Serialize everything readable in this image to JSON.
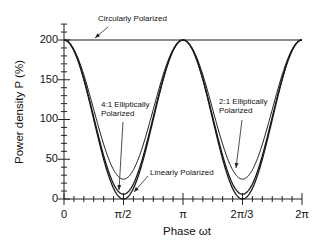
{
  "chart_data": {
    "type": "line",
    "title": "",
    "xlabel": "Phase ωt",
    "ylabel": "Power density P  (%)",
    "xlim": [
      0,
      6.2832
    ],
    "ylim": [
      0,
      200
    ],
    "x_tick_labels": [
      "0",
      "π/2",
      "π",
      "2π/3",
      "2π"
    ],
    "y_tick_labels": [
      "0",
      "50",
      "100",
      "150",
      "200"
    ],
    "grid": false,
    "legend": "none (inline annotations)",
    "series": [
      {
        "name": "Circularly Polarized",
        "formula": "P = 200 (constant)",
        "min": 200,
        "max": 200
      },
      {
        "name": "2:1 Elliptically Polarized",
        "min": 25,
        "max": 200,
        "min_at": [
          "π/2",
          "3π/2"
        ],
        "max_at": [
          "0",
          "π",
          "2π"
        ]
      },
      {
        "name": "4:1 Elliptically Polarized",
        "min": 6,
        "max": 200,
        "min_at": [
          "π/2",
          "3π/2"
        ],
        "max_at": [
          "0",
          "π",
          "2π"
        ]
      },
      {
        "name": "Linearly Polarized",
        "formula": "P = 200 cos²(ωt)",
        "min": 0,
        "max": 200,
        "min_at": [
          "π/2",
          "3π/2"
        ],
        "max_at": [
          "0",
          "π",
          "2π"
        ]
      }
    ],
    "annotations": [
      "Circularly Polarized",
      "4:1 Elliptically Polarized",
      "2:1 Elliptically Polarized",
      "Linearly Polarized"
    ]
  },
  "labels": {
    "xlabel": "Phase ωt",
    "ylabel": "Power density P  (%)",
    "yticks": [
      "0",
      "50",
      "100",
      "150",
      "200"
    ],
    "xticks": [
      "0",
      "π/2",
      "π",
      "2π/3",
      "2π"
    ],
    "ann_circular": "Circularly Polarized",
    "ann_41_line1": "4:1 Elliptically",
    "ann_41_line2": "Polarized",
    "ann_21_line1": "2:1 Elliptically",
    "ann_21_line2": "Polarized",
    "ann_linear": "Linearly Polarized"
  },
  "style": {
    "line_color": "#1a1a1a",
    "axis_color": "#222222"
  }
}
